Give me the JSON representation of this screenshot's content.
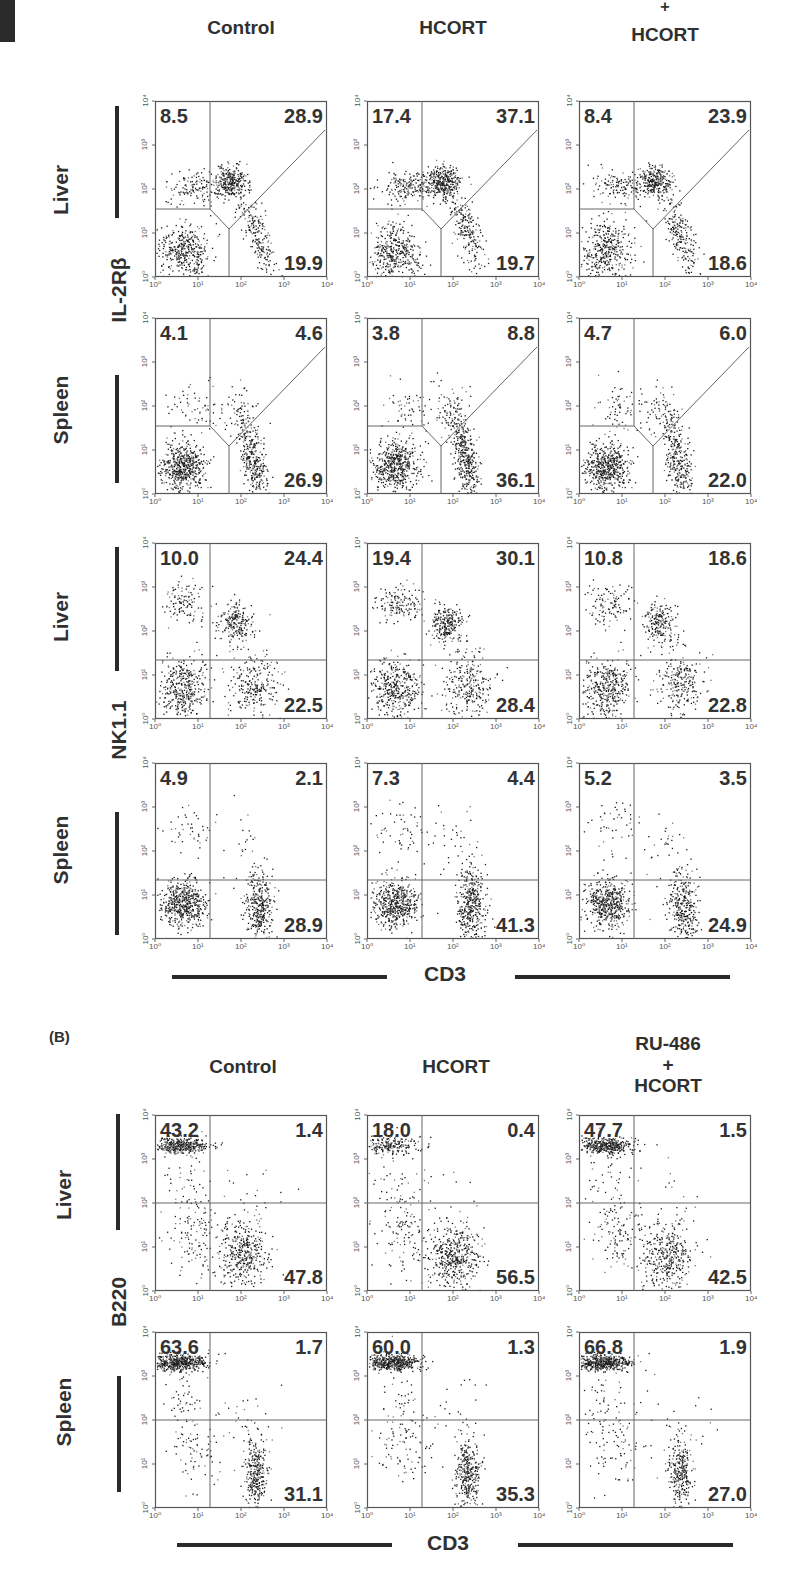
{
  "figure": {
    "section_b_label": "(B)",
    "section_a_headers": [
      "Control",
      "HCORT",
      "+\nHCORT"
    ],
    "section_a_header_col3_top": "+",
    "section_a_header_col3_bottom": "HCORT",
    "section_b_headers": [
      "Control",
      "HCORT",
      "RU-486\n+\nHCORT"
    ],
    "section_b_header_col3_line1": "RU-486",
    "section_b_header_col3_line2": "+",
    "section_b_header_col3_line3": "HCORT",
    "row_labels": {
      "liver": "Liver",
      "spleen": "Spleen"
    },
    "markers": {
      "il2rb": "IL-2Rβ",
      "nk11": "NK1.1",
      "b220": "B220"
    },
    "x_axis_title": "CD3",
    "axis_ticks": [
      "10⁰",
      "10¹",
      "10²",
      "10³",
      "10⁴"
    ]
  },
  "chart_data": {
    "type": "scatter",
    "xlabel": "CD3",
    "x_scale": "log",
    "xlim": [
      1,
      10000
    ],
    "y_scale": "log",
    "ylim": [
      1,
      10000
    ],
    "conditions_A": [
      "Control",
      "HCORT",
      "+ HCORT"
    ],
    "conditions_B": [
      "Control",
      "HCORT",
      "RU-486 + HCORT"
    ],
    "panels": [
      {
        "section": "A",
        "ylabel": "IL-2Rβ",
        "tissue": "Liver",
        "condition": "Control",
        "upper_left": 8.5,
        "upper_right": 28.9,
        "lower_right": 19.9
      },
      {
        "section": "A",
        "ylabel": "IL-2Rβ",
        "tissue": "Liver",
        "condition": "HCORT",
        "upper_left": 17.4,
        "upper_right": 37.1,
        "lower_right": 19.7
      },
      {
        "section": "A",
        "ylabel": "IL-2Rβ",
        "tissue": "Liver",
        "condition": "+ HCORT",
        "upper_left": 8.4,
        "upper_right": 23.9,
        "lower_right": 18.6
      },
      {
        "section": "A",
        "ylabel": "IL-2Rβ",
        "tissue": "Spleen",
        "condition": "Control",
        "upper_left": 4.1,
        "upper_right": 4.6,
        "lower_right": 26.9
      },
      {
        "section": "A",
        "ylabel": "IL-2Rβ",
        "tissue": "Spleen",
        "condition": "HCORT",
        "upper_left": 3.8,
        "upper_right": 8.8,
        "lower_right": 36.1
      },
      {
        "section": "A",
        "ylabel": "IL-2Rβ",
        "tissue": "Spleen",
        "condition": "+ HCORT",
        "upper_left": 4.7,
        "upper_right": 6.0,
        "lower_right": 22.0
      },
      {
        "section": "A",
        "ylabel": "NK1.1",
        "tissue": "Liver",
        "condition": "Control",
        "upper_left": 10.0,
        "upper_right": 24.4,
        "lower_right": 22.5
      },
      {
        "section": "A",
        "ylabel": "NK1.1",
        "tissue": "Liver",
        "condition": "HCORT",
        "upper_left": 19.4,
        "upper_right": 30.1,
        "lower_right": 28.4
      },
      {
        "section": "A",
        "ylabel": "NK1.1",
        "tissue": "Liver",
        "condition": "+ HCORT",
        "upper_left": 10.8,
        "upper_right": 18.6,
        "lower_right": 22.8
      },
      {
        "section": "A",
        "ylabel": "NK1.1",
        "tissue": "Spleen",
        "condition": "Control",
        "upper_left": 4.9,
        "upper_right": 2.1,
        "lower_right": 28.9
      },
      {
        "section": "A",
        "ylabel": "NK1.1",
        "tissue": "Spleen",
        "condition": "HCORT",
        "upper_left": 7.3,
        "upper_right": 4.4,
        "lower_right": 41.3
      },
      {
        "section": "A",
        "ylabel": "NK1.1",
        "tissue": "Spleen",
        "condition": "+ HCORT",
        "upper_left": 5.2,
        "upper_right": 3.5,
        "lower_right": 24.9
      },
      {
        "section": "B",
        "ylabel": "B220",
        "tissue": "Liver",
        "condition": "Control",
        "upper_left": 43.2,
        "upper_right": 1.4,
        "lower_right": 47.8
      },
      {
        "section": "B",
        "ylabel": "B220",
        "tissue": "Liver",
        "condition": "HCORT",
        "upper_left": 18.0,
        "upper_right": 0.4,
        "lower_right": 56.5
      },
      {
        "section": "B",
        "ylabel": "B220",
        "tissue": "Liver",
        "condition": "RU-486 + HCORT",
        "upper_left": 47.7,
        "upper_right": 1.5,
        "lower_right": 42.5
      },
      {
        "section": "B",
        "ylabel": "B220",
        "tissue": "Spleen",
        "condition": "Control",
        "upper_left": 63.6,
        "upper_right": 1.7,
        "lower_right": 31.1
      },
      {
        "section": "B",
        "ylabel": "B220",
        "tissue": "Spleen",
        "condition": "HCORT",
        "upper_left": 60.0,
        "upper_right": 1.3,
        "lower_right": 35.3
      },
      {
        "section": "B",
        "ylabel": "B220",
        "tissue": "Spleen",
        "condition": "RU-486 + HCORT",
        "upper_left": 66.8,
        "upper_right": 1.9,
        "lower_right": 27.0
      }
    ],
    "grid": false,
    "legend": "none"
  }
}
